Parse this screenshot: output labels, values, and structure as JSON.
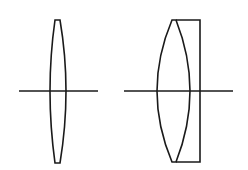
{
  "diagram": {
    "type": "optical-lens-schematic",
    "background": "#ffffff",
    "stroke_color": "#1a1a1a",
    "elements": [
      {
        "name": "biconvex-lens",
        "optical_axis": {
          "x1": 19,
          "x2": 98,
          "y": 91
        },
        "lens": {
          "top_x1": 55,
          "top_x2": 60,
          "top_y": 20,
          "bottom_x1": 55,
          "bottom_x2": 60,
          "bottom_y": 163,
          "left_extreme_x": 50,
          "right_extreme_x": 66
        }
      },
      {
        "name": "cemented-doublet-lens",
        "optical_axis": {
          "x1": 124,
          "x2": 233,
          "y": 91
        },
        "convex_element": {
          "top_x1": 172,
          "top_x2": 176,
          "top_y": 20,
          "bottom_x1": 172,
          "bottom_x2": 176,
          "bottom_y": 162,
          "left_extreme_x": 157,
          "right_extreme_x": 190
        },
        "flat_plate": {
          "right_x": 200,
          "top_y": 20,
          "bottom_y": 162
        }
      }
    ]
  }
}
